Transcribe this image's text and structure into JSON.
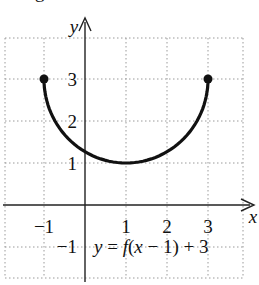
{
  "figure_label": "g.",
  "chart_data": {
    "type": "line",
    "title": "",
    "equation_label": "y = f(x − 1) + 3",
    "xlabel": "x",
    "ylabel": "y",
    "xlim": [
      -2,
      4
    ],
    "ylim": [
      -1.8,
      4
    ],
    "grid": true,
    "x_ticks": [
      "−1",
      "1",
      "2",
      "3"
    ],
    "y_ticks": [
      "3",
      "2",
      "1",
      "−1"
    ],
    "series": [
      {
        "name": "y = f(x − 1) + 3",
        "description": "lower semicircle centered at (1,3) with radius 2, closed endpoints",
        "x": [
          -1,
          -0.5,
          0,
          0.5,
          1,
          1.5,
          2,
          2.5,
          3
        ],
        "y": [
          3,
          1.68,
          1.27,
          1.06,
          1,
          1.06,
          1.27,
          1.68,
          3
        ],
        "endpoints": [
          [
            -1,
            3
          ],
          [
            3,
            3
          ]
        ]
      }
    ]
  },
  "colors": {
    "curve": "#111111",
    "grid": "#9a9a9a",
    "axis": "#222222"
  }
}
